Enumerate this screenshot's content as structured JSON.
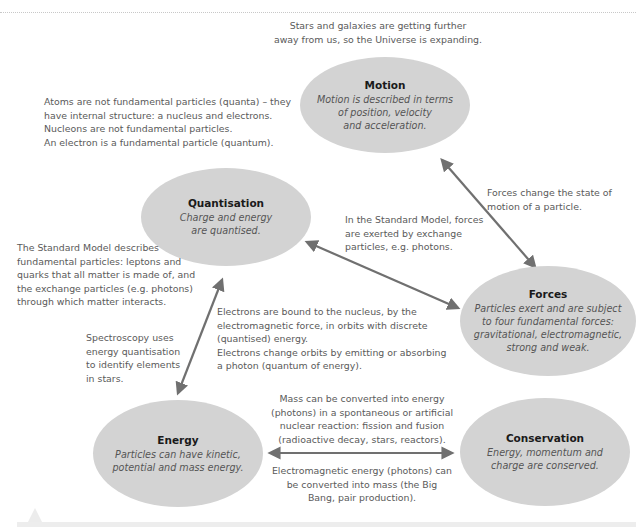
{
  "diagram": {
    "nodes": {
      "motion": {
        "title": "Motion",
        "description": "Motion is described in terms\nof position, velocity\nand acceleration."
      },
      "quantisation": {
        "title": "Quantisation",
        "description": "Charge and energy\nare quantised."
      },
      "forces": {
        "title": "Forces",
        "description": "Particles exert and are subject\nto four fundamental forces:\ngravitational, electromagnetic,\nstrong and weak."
      },
      "energy": {
        "title": "Energy",
        "description": "Particles can have kinetic,\npotential and mass energy."
      },
      "conservation": {
        "title": "Conservation",
        "description": "Energy, momentum and\ncharge are conserved."
      }
    },
    "notes": {
      "universe_expanding": "Stars and galaxies are getting further\naway from us, so the Universe is expanding.",
      "atoms": "Atoms are not fundamental particles (quanta) – they\nhave internal structure: a nucleus and electrons.\nNucleons are not fundamental particles.\nAn electron is a fundamental particle (quantum).",
      "forces_change_motion": "Forces change the state of\nmotion of a particle.",
      "exchange_particles": "In the Standard Model, forces\nare exerted by exchange\nparticles, e.g. photons.",
      "standard_model": "The Standard Model describes\nfundamental particles: leptons and\nquarks that all matter is made of, and\nthe exchange particles (e.g. photons)\nthrough which matter interacts.",
      "electrons_bound": "Electrons are bound to the nucleus, by the\nelectromagnetic force, in orbits with discrete\n(quantised) energy.\nElectrons change orbits by emitting or absorbing\na photon (quantum of energy).",
      "spectroscopy": "Spectroscopy uses\nenergy quantisation\nto identify elements\nin stars.",
      "mass_to_energy": "Mass can be converted into energy\n(photons) in a spontaneous or artificial\nnuclear reaction: fission and fusion\n(radioactive decay, stars, reactors).",
      "energy_to_mass": "Electromagnetic energy (photons) can\nbe converted into mass (the Big\nBang, pair production)."
    },
    "edges": [
      {
        "from": "motion",
        "to": "forces"
      },
      {
        "from": "quantisation",
        "to": "forces"
      },
      {
        "from": "quantisation",
        "to": "energy"
      },
      {
        "from": "energy",
        "to": "conservation"
      }
    ],
    "colors": {
      "node_fill": "#d3d3d3",
      "arrow": "#707070",
      "note_text": "#5a5a5a",
      "title_text": "#1a1a1a"
    }
  }
}
